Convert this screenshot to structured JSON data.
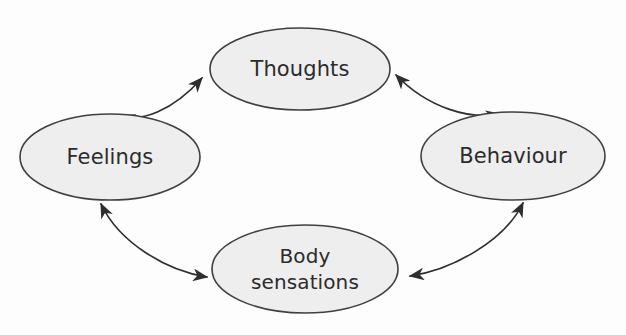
{
  "diagram": {
    "type": "cycle-diagram",
    "background_color": "#fdfdfd",
    "node_fill_color": "#eeeeee",
    "node_stroke_color": "#3f3f3f",
    "arrow_color": "#2e2e2e",
    "label_color": "#2b2b2b",
    "nodes": [
      {
        "id": "thoughts",
        "label": "Thoughts",
        "position": "top",
        "cx": 300,
        "cy": 69,
        "rx": 90,
        "ry": 41
      },
      {
        "id": "feelings",
        "label": "Feelings",
        "position": "left",
        "cx": 110,
        "cy": 157,
        "rx": 90,
        "ry": 43
      },
      {
        "id": "behaviour",
        "label": "Behaviour",
        "position": "right",
        "cx": 513,
        "cy": 156,
        "rx": 92,
        "ry": 44
      },
      {
        "id": "body-sensations",
        "label_line1": "Body",
        "label_line2": "sensations",
        "label": "Body sensations",
        "position": "bottom",
        "cx": 305,
        "cy": 269,
        "rx": 93,
        "ry": 44
      }
    ],
    "links": [
      {
        "id": "thoughts-feelings",
        "from": "Thoughts",
        "to": "Feelings",
        "direction": "bidirectional",
        "quadrant": "upper-left"
      },
      {
        "id": "thoughts-behaviour",
        "from": "Thoughts",
        "to": "Behaviour",
        "direction": "bidirectional",
        "quadrant": "upper-right"
      },
      {
        "id": "feelings-body-sensations",
        "from": "Feelings",
        "to": "Body sensations",
        "direction": "bidirectional",
        "quadrant": "lower-left"
      },
      {
        "id": "behaviour-body-sensations",
        "from": "Behaviour",
        "to": "Body sensations",
        "direction": "bidirectional",
        "quadrant": "lower-right"
      }
    ]
  }
}
